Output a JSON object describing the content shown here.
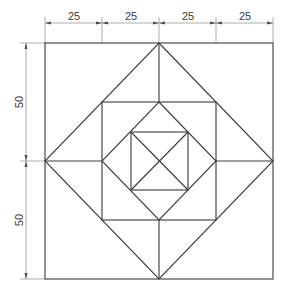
{
  "drawing": {
    "title": "Nested squares and diamonds geometric construction",
    "colors": {
      "line": "#3a3a3a",
      "dimension": "#8a8a8a",
      "background": "#ffffff"
    },
    "top_dimensions": [
      {
        "label": "25"
      },
      {
        "label": "25"
      },
      {
        "label": "25"
      },
      {
        "label": "25"
      }
    ],
    "left_dimensions": [
      {
        "label": "50"
      },
      {
        "label": "50"
      }
    ],
    "shapes": [
      {
        "name": "outer-square",
        "size": 100
      },
      {
        "name": "outer-diamond"
      },
      {
        "name": "middle-square",
        "size": 50
      },
      {
        "name": "inner-diamond"
      },
      {
        "name": "inner-square"
      },
      {
        "name": "inner-square-diagonals"
      },
      {
        "name": "midpoint-connector-lines"
      }
    ]
  }
}
